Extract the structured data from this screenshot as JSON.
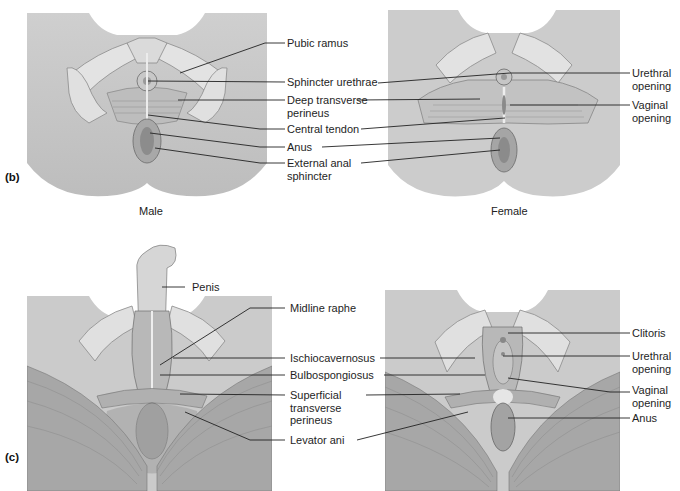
{
  "figure": {
    "panels": [
      {
        "id": "b",
        "tag": "(b)",
        "captions": {
          "male": "Male",
          "female": "Female"
        },
        "center_labels": [
          {
            "text": "Pubic ramus"
          },
          {
            "text": "Sphincter urethrae"
          },
          {
            "text": "Deep transverse",
            "text2": "perineus"
          },
          {
            "text": "Central tendon"
          },
          {
            "text": "Anus"
          },
          {
            "text": "External anal",
            "text2": "sphincter"
          }
        ],
        "right_labels": [
          {
            "text": "Urethral",
            "text2": "opening"
          },
          {
            "text": "Vaginal",
            "text2": "opening"
          }
        ]
      },
      {
        "id": "c",
        "tag": "(c)",
        "center_labels": [
          {
            "text": "Penis"
          },
          {
            "text": "Midline raphe"
          },
          {
            "text": "Ischiocavernosus"
          },
          {
            "text": "Bulbospongiosus"
          },
          {
            "text": "Superficial",
            "text2": "transverse",
            "text3": "perineus"
          },
          {
            "text": "Levator ani"
          }
        ],
        "right_labels": [
          {
            "text": "Clitoris"
          },
          {
            "text": "Urethral",
            "text2": "opening"
          },
          {
            "text": "Vaginal",
            "text2": "opening"
          },
          {
            "text": "Anus"
          }
        ]
      }
    ]
  }
}
